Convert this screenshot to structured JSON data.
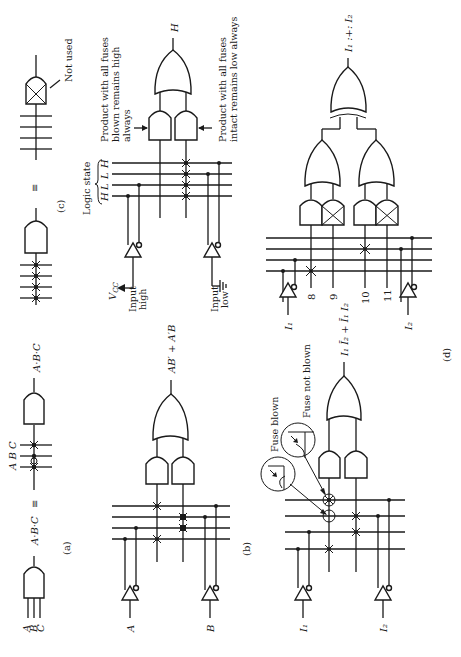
{
  "figure": {
    "orientation": "rotated 90 degrees counter-clockwise",
    "panels": {
      "a": {
        "caption": "(a)",
        "inputs": [
          "A",
          "B",
          "C"
        ],
        "equiv_left": "A·B·C",
        "equiv_sign": "≡",
        "lines_label": "A B C",
        "output": "A·B·C"
      },
      "b": {
        "caption": "(b)",
        "input_a": "A",
        "input_b": "B",
        "output": "AB′ + A′B"
      },
      "c": {
        "caption": "(c)",
        "equiv_sign": "≡",
        "not_used": "Not used",
        "logic_state_label": "Logic state",
        "logic_states": [
          "H",
          "L",
          "L",
          "H"
        ],
        "vcc": "V",
        "vcc_sub": "CC",
        "input_high_1": "Input",
        "input_high_2": "high",
        "input_low_1": "Input",
        "input_low_2": "low",
        "output": "H",
        "note_blown_1": "Product with all fuses",
        "note_blown_2": "blown remains high",
        "note_blown_3": "always",
        "note_intact_1": "Product with all fuses",
        "note_intact_2": "intact remains low always"
      },
      "d": {
        "caption": "(d)",
        "input_1": "I₁",
        "input_2": "I₂",
        "fuse_blown": "Fuse blown",
        "fuse_not_blown": "Fuse not blown",
        "output_left": "I₁ Ī₂ + Ī₁ I₂",
        "term_numbers": [
          "8",
          "9",
          "10",
          "11"
        ],
        "output_right": "I₁ :+: I₂"
      }
    }
  }
}
